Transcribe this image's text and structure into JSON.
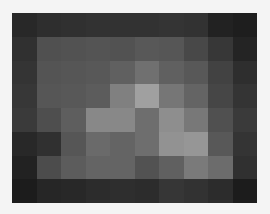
{
  "image": {
    "description": "Low-resolution grayscale pixel grid (blurred heatmap-like image)",
    "background": "#f4f4f4",
    "rows": 8,
    "cols": 10
  },
  "chart_data": {
    "type": "heatmap",
    "title": "",
    "xlabel": "",
    "ylabel": "",
    "colormap": "gray",
    "value_range": [
      0,
      255
    ],
    "values": [
      [
        40,
        46,
        48,
        50,
        50,
        50,
        52,
        50,
        34,
        30
      ],
      [
        48,
        80,
        82,
        84,
        82,
        88,
        86,
        72,
        55,
        36
      ],
      [
        52,
        84,
        86,
        88,
        96,
        112,
        96,
        88,
        66,
        46
      ],
      [
        55,
        86,
        88,
        92,
        128,
        160,
        118,
        100,
        70,
        52
      ],
      [
        58,
        78,
        94,
        136,
        136,
        110,
        142,
        120,
        80,
        58
      ],
      [
        40,
        48,
        86,
        106,
        100,
        110,
        146,
        150,
        88,
        52
      ],
      [
        34,
        76,
        92,
        100,
        100,
        82,
        96,
        122,
        108,
        48
      ],
      [
        28,
        38,
        40,
        44,
        46,
        44,
        54,
        50,
        44,
        28
      ]
    ]
  }
}
